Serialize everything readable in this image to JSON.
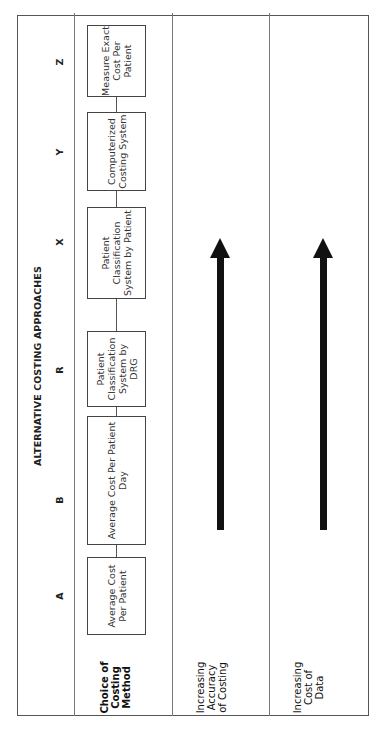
{
  "diagram": {
    "title": "ALTERNATIVE COSTING APPROACHES",
    "approaches": [
      {
        "letter": "A",
        "label": "Average Cost Per Patient"
      },
      {
        "letter": "B",
        "label": "Average Cost Per Patient Day"
      },
      {
        "letter": "R",
        "label": "Patient Classification System by DRG"
      },
      {
        "letter": "X",
        "label": "Patient Classification System by Patient"
      },
      {
        "letter": "Y",
        "label": "Computerized Costing System"
      },
      {
        "letter": "Z",
        "label": "Measure Exact Cost Per Patient"
      }
    ],
    "rows": [
      {
        "label": "Choice of Costing Method"
      },
      {
        "label": "Increasing Accuracy of Costing",
        "arrow": "right"
      },
      {
        "label": "Increasing Cost of Data",
        "arrow": "right"
      }
    ],
    "colors": {
      "line": "#555555",
      "arrow": "#111111",
      "text": "#222222"
    }
  }
}
